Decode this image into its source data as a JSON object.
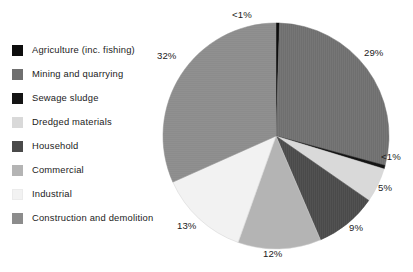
{
  "chart_data": {
    "type": "pie",
    "title": "",
    "subtitle": "",
    "xlabel": "",
    "ylabel": "",
    "legend_position": "left",
    "grid": false,
    "start_angle_deg": 0,
    "direction": "clockwise",
    "categories": [
      "Agriculture (inc. fishing)",
      "Mining and quarrying",
      "Sewage sludge",
      "Dredged materials",
      "Household",
      "Commercial",
      "Industrial",
      "Construction and demolition"
    ],
    "values": [
      0.5,
      29,
      0.5,
      5,
      9,
      12,
      13,
      32
    ],
    "value_labels": [
      "<1%",
      "29%",
      "<1%",
      "5%",
      "9%",
      "12%",
      "13%",
      "32%"
    ],
    "colors": [
      "#0d0d0d",
      "#6f6f6f",
      "#141414",
      "#d9d9d9",
      "#4a4a4a",
      "#b4b4b4",
      "#f2f2f2",
      "#8c8c8c"
    ],
    "annotations": []
  },
  "legend": {
    "items": [
      {
        "label": "Agriculture (inc. fishing)",
        "color": "#0d0d0d"
      },
      {
        "label": "Mining and quarrying",
        "color": "#6f6f6f"
      },
      {
        "label": "Sewage sludge",
        "color": "#141414"
      },
      {
        "label": "Dredged materials",
        "color": "#d9d9d9"
      },
      {
        "label": "Household",
        "color": "#4a4a4a"
      },
      {
        "label": "Commercial",
        "color": "#b4b4b4"
      },
      {
        "label": "Industrial",
        "color": "#f2f2f2"
      },
      {
        "label": "Construction and demolition",
        "color": "#8c8c8c"
      }
    ]
  },
  "pie": {
    "center_x": 276,
    "center_y": 136,
    "radius": 113,
    "labels": [
      {
        "text": "<1%",
        "left": 232,
        "top": 10,
        "name": "pie-label-agriculture"
      },
      {
        "text": "29%",
        "left": 364,
        "top": 48,
        "name": "pie-label-mining-and-quarrying"
      },
      {
        "text": "<1%",
        "left": 381,
        "top": 152,
        "name": "pie-label-sewage-sludge"
      },
      {
        "text": "5%",
        "left": 378,
        "top": 183,
        "name": "pie-label-dredged-materials"
      },
      {
        "text": "9%",
        "left": 349,
        "top": 223,
        "name": "pie-label-household"
      },
      {
        "text": "12%",
        "left": 263,
        "top": 249,
        "name": "pie-label-commercial"
      },
      {
        "text": "13%",
        "left": 177,
        "top": 221,
        "name": "pie-label-industrial"
      },
      {
        "text": "32%",
        "left": 157,
        "top": 51,
        "name": "pie-label-construction-and-demolition"
      }
    ]
  }
}
